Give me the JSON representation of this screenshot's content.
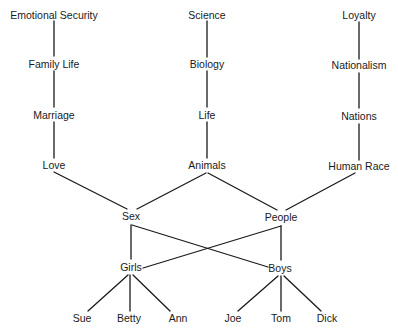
{
  "diagram": {
    "type": "concept-hierarchy",
    "nodes": {
      "emotional_security": {
        "label": "Emotional Security",
        "x": 54,
        "y": 15
      },
      "family_life": {
        "label": "Family Life",
        "x": 54,
        "y": 64
      },
      "marriage": {
        "label": "Marriage",
        "x": 54,
        "y": 115
      },
      "love": {
        "label": "Love",
        "x": 54,
        "y": 165
      },
      "science": {
        "label": "Science",
        "x": 207,
        "y": 15
      },
      "biology": {
        "label": "Biology",
        "x": 207,
        "y": 64
      },
      "life": {
        "label": "Life",
        "x": 207,
        "y": 115
      },
      "animals": {
        "label": "Animals",
        "x": 207,
        "y": 165
      },
      "loyalty": {
        "label": "Loyalty",
        "x": 359,
        "y": 15
      },
      "nationalism": {
        "label": "Nationalism",
        "x": 359,
        "y": 65
      },
      "nations": {
        "label": "Nations",
        "x": 359,
        "y": 116
      },
      "human_race": {
        "label": "Human Race",
        "x": 359,
        "y": 166
      },
      "sex": {
        "label": "Sex",
        "x": 131,
        "y": 216
      },
      "people": {
        "label": "People",
        "x": 281,
        "y": 217
      },
      "girls": {
        "label": "Girls",
        "x": 131,
        "y": 267
      },
      "boys": {
        "label": "Boys",
        "x": 280,
        "y": 268
      },
      "sue": {
        "label": "Sue",
        "x": 82,
        "y": 318
      },
      "betty": {
        "label": "Betty",
        "x": 129,
        "y": 318
      },
      "ann": {
        "label": "Ann",
        "x": 178,
        "y": 318
      },
      "joe": {
        "label": "Joe",
        "x": 233,
        "y": 318
      },
      "tom": {
        "label": "Tom",
        "x": 281,
        "y": 318
      },
      "dick": {
        "label": "Dick",
        "x": 327,
        "y": 318
      }
    },
    "edges": [
      [
        "emotional_security",
        "family_life"
      ],
      [
        "family_life",
        "marriage"
      ],
      [
        "marriage",
        "love"
      ],
      [
        "science",
        "biology"
      ],
      [
        "biology",
        "life"
      ],
      [
        "life",
        "animals"
      ],
      [
        "loyalty",
        "nationalism"
      ],
      [
        "nationalism",
        "nations"
      ],
      [
        "nations",
        "human_race"
      ],
      [
        "love",
        "sex"
      ],
      [
        "animals",
        "sex"
      ],
      [
        "animals",
        "people"
      ],
      [
        "human_race",
        "people"
      ],
      [
        "sex",
        "girls"
      ],
      [
        "sex",
        "boys"
      ],
      [
        "people",
        "girls"
      ],
      [
        "people",
        "boys"
      ],
      [
        "girls",
        "sue"
      ],
      [
        "girls",
        "betty"
      ],
      [
        "girls",
        "ann"
      ],
      [
        "boys",
        "joe"
      ],
      [
        "boys",
        "tom"
      ],
      [
        "boys",
        "dick"
      ]
    ],
    "colors": {
      "line": "#1a1a1a",
      "text": "#1a1a1a",
      "background": "#ffffff"
    }
  }
}
